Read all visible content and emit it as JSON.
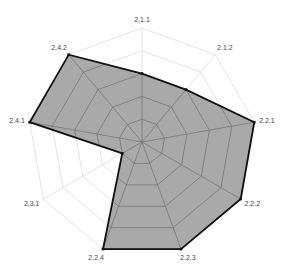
{
  "chart_data": {
    "type": "radar",
    "title": "",
    "categories": [
      "2.1.1",
      "2.1.2",
      "2.2.1",
      "2.2.2",
      "2.2.3",
      "2.2.4",
      "2.3.1",
      "2.4.1",
      "2.4.2"
    ],
    "series": [
      {
        "name": "",
        "values": [
          0.6,
          0.6,
          1.0,
          1.0,
          1.0,
          1.0,
          0.2,
          1.0,
          1.0
        ]
      }
    ],
    "rlim": [
      0,
      1
    ],
    "grid_levels": 5,
    "grid": true,
    "legend": false
  },
  "style": {
    "fill_color": "#a9a9a9",
    "outline_color": "#111111",
    "grid_color": "#dcdcdc",
    "grid_inside_color": "#777777",
    "label_color": "#444444"
  },
  "geometry": {
    "cx": 142,
    "cy": 142,
    "radius": 114
  }
}
